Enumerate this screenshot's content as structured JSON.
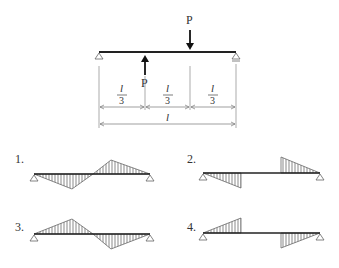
{
  "top_diagram": {
    "force_down_label": "P",
    "force_up_label": "P",
    "segment_labels": [
      {
        "num": "l",
        "den": "3"
      },
      {
        "num": "l",
        "den": "3"
      },
      {
        "num": "l",
        "den": "3"
      }
    ],
    "total_length_label": "l"
  },
  "options": [
    {
      "label": "1.",
      "description": "Negative triangle in first third, positive triangle in middle-to-right, antisymmetric continuous"
    },
    {
      "label": "2.",
      "description": "Negative triangle on first third with jump, zero in middle, positive triangle on last third"
    },
    {
      "label": "3.",
      "description": "Positive peak at l/3, negative peak at 2l/3, continuous"
    },
    {
      "label": "4.",
      "description": "Positive triangle on first third with jump, zero in middle, negative triangle on last third"
    }
  ],
  "colors": {
    "line": "#333333",
    "hatch": "#555555",
    "thin": "#888888"
  }
}
